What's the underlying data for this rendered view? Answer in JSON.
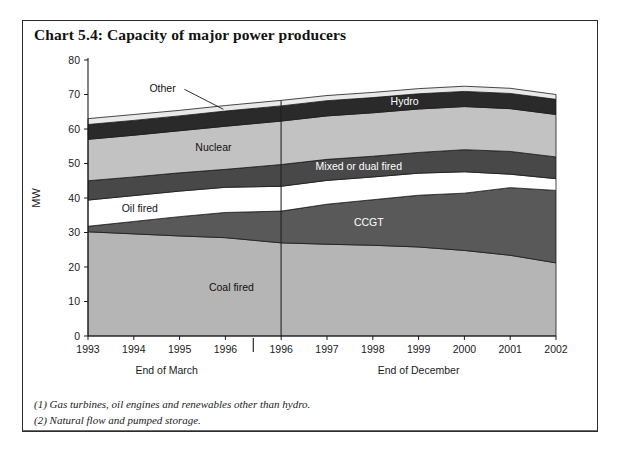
{
  "title": "Chart 5.4: Capacity of major power producers",
  "notes": [
    "(1) Gas turbines, oil engines and renewables other than hydro.",
    "(2) Natural flow and pumped storage."
  ],
  "axis": {
    "ylabel": "MW",
    "yticks": [
      "0",
      "10",
      "20",
      "30",
      "40",
      "50",
      "60",
      "70",
      "80"
    ],
    "xticks": [
      "1993",
      "1994",
      "1995",
      "1996",
      "1996",
      "1997",
      "1998",
      "1999",
      "2000",
      "2001",
      "2002"
    ],
    "period_labels": [
      "End of March",
      "End of December"
    ]
  },
  "series_labels": {
    "coal": "Coal fired",
    "ccgt": "CCGT",
    "oil": "Oil fired",
    "mixed": "Mixed or dual fired",
    "nuclear": "Nuclear",
    "hydro": "Hydro",
    "other": "Other"
  },
  "colors": {
    "coal": "#b5b5b5",
    "ccgt": "#595959",
    "oil": "#ffffff",
    "mixed": "#484848",
    "nuclear": "#c2c2c2",
    "hydro": "#2a2a2a",
    "other": "#e9e9e9",
    "outline": "#1a1a1a",
    "frame": "#2b2b2b"
  },
  "chart_data": {
    "type": "area",
    "title": "Chart 5.4: Capacity of major power producers",
    "xlabel": "",
    "ylabel": "MW",
    "ylim": [
      0,
      80
    ],
    "grid": false,
    "legend_position": "inline-labels",
    "categories": [
      "1993",
      "1994",
      "1995",
      "1996",
      "1996b",
      "1997",
      "1998",
      "1999",
      "2000",
      "2001",
      "2002"
    ],
    "stacked": true,
    "series": [
      {
        "name": "Coal fired",
        "values": [
          30.2,
          29.6,
          29.0,
          28.5,
          27.0,
          26.6,
          26.3,
          25.8,
          24.8,
          23.4,
          21.2
        ]
      },
      {
        "name": "CCGT",
        "values": [
          1.6,
          3.6,
          5.6,
          7.3,
          9.2,
          11.6,
          13.2,
          15.0,
          16.6,
          19.6,
          21.0
        ]
      },
      {
        "name": "Oil fired",
        "values": [
          7.6,
          7.5,
          7.4,
          7.3,
          7.2,
          6.9,
          6.6,
          6.4,
          6.2,
          3.9,
          3.4
        ]
      },
      {
        "name": "Mixed or dual fired",
        "values": [
          5.6,
          5.4,
          5.3,
          5.2,
          6.3,
          6.1,
          6.0,
          6.0,
          6.4,
          6.6,
          6.3
        ]
      },
      {
        "name": "Nuclear",
        "values": [
          12.0,
          12.1,
          12.2,
          12.5,
          12.6,
          12.6,
          12.6,
          12.6,
          12.5,
          12.4,
          12.3
        ]
      },
      {
        "name": "Hydro",
        "values": [
          4.3,
          4.3,
          4.3,
          4.4,
          4.4,
          4.4,
          4.4,
          4.4,
          4.4,
          4.4,
          4.4
        ]
      },
      {
        "name": "Other",
        "values": [
          1.7,
          1.7,
          1.6,
          1.6,
          1.6,
          1.5,
          1.5,
          1.5,
          1.5,
          1.5,
          1.4
        ]
      }
    ],
    "totals": [
      63.0,
      64.2,
      65.4,
      66.8,
      68.3,
      69.7,
      70.6,
      71.7,
      72.4,
      71.8,
      70.0
    ],
    "annotations": [
      {
        "text": "Other",
        "series": "Other",
        "leader": true
      },
      {
        "text": "Hydro",
        "series": "Hydro"
      },
      {
        "text": "Nuclear",
        "series": "Nuclear"
      },
      {
        "text": "Mixed or dual fired",
        "series": "Mixed or dual fired"
      },
      {
        "text": "Oil fired",
        "series": "Oil fired"
      },
      {
        "text": "CCGT",
        "series": "CCGT"
      },
      {
        "text": "Coal fired",
        "series": "Coal fired"
      }
    ]
  }
}
